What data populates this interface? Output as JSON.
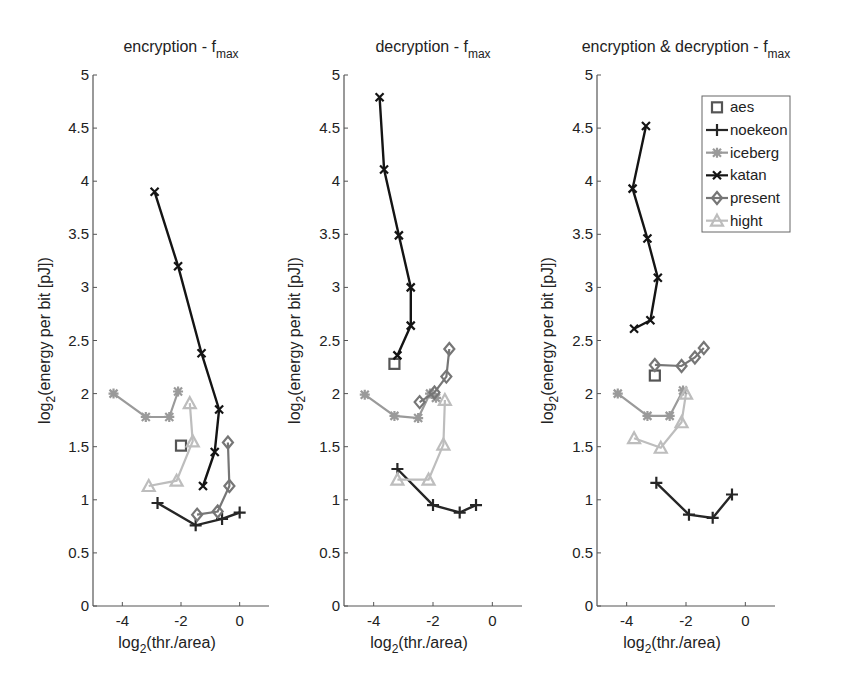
{
  "figure": {
    "width": 845,
    "height": 691,
    "ylabel": "log2(energy per bit [pJ])",
    "ylabel_main": "log",
    "ylabel_sub": "2",
    "ylabel_rest": "(energy per bit [pJ])",
    "xlabel_main": "log",
    "xlabel_sub": "2",
    "xlabel_rest": "(thr./area)",
    "colors": {
      "aes": "#555555",
      "noekeon": "#262626",
      "iceberg": "#9a9a9a",
      "katan": "#141414",
      "present": "#767676",
      "hight": "#bdbdbd",
      "axis": "#555555"
    }
  },
  "legend": {
    "entries": [
      {
        "name": "aes",
        "marker": "square"
      },
      {
        "name": "noekeon",
        "marker": "plus"
      },
      {
        "name": "iceberg",
        "marker": "star"
      },
      {
        "name": "katan",
        "marker": "x"
      },
      {
        "name": "present",
        "marker": "diamond"
      },
      {
        "name": "hight",
        "marker": "triangle"
      }
    ]
  },
  "chart_data": [
    {
      "type": "line",
      "title": "encryption - f_max",
      "title_main": "encryption - f",
      "title_sub": "max",
      "xlabel": "log2(thr./area)",
      "ylabel": "log2(energy per bit [pJ])",
      "xlim": [
        -5,
        1
      ],
      "ylim": [
        0,
        5
      ],
      "xticks": [
        -4,
        -2,
        0
      ],
      "yticks": [
        0,
        0.5,
        1,
        1.5,
        2,
        2.5,
        3,
        3.5,
        4,
        4.5,
        5
      ],
      "ytick_labels": [
        "0",
        "0.5",
        "1",
        "1.5",
        "2",
        "2.5",
        "3",
        "3.5",
        "4",
        "4.5",
        "5"
      ],
      "grid": false,
      "legend": false,
      "series": [
        {
          "name": "aes",
          "points": [
            [
              -2.0,
              1.51
            ]
          ]
        },
        {
          "name": "noekeon",
          "points": [
            [
              -2.8,
              0.97
            ],
            [
              -1.5,
              0.76
            ],
            [
              -0.6,
              0.82
            ],
            [
              0.0,
              0.88
            ]
          ]
        },
        {
          "name": "iceberg",
          "points": [
            [
              -4.3,
              2.0
            ],
            [
              -3.2,
              1.78
            ],
            [
              -2.4,
              1.78
            ],
            [
              -2.1,
              2.02
            ]
          ]
        },
        {
          "name": "katan",
          "points": [
            [
              -2.9,
              3.9
            ],
            [
              -2.1,
              3.2
            ],
            [
              -1.3,
              2.38
            ],
            [
              -0.7,
              1.85
            ],
            [
              -0.85,
              1.45
            ],
            [
              -1.25,
              1.13
            ]
          ]
        },
        {
          "name": "present",
          "points": [
            [
              -1.45,
              0.86
            ],
            [
              -0.75,
              0.89
            ],
            [
              -0.35,
              1.13
            ],
            [
              -0.4,
              1.54
            ]
          ]
        },
        {
          "name": "hight",
          "points": [
            [
              -3.1,
              1.13
            ],
            [
              -2.15,
              1.18
            ],
            [
              -1.6,
              1.55
            ],
            [
              -1.7,
              1.91
            ]
          ]
        }
      ]
    },
    {
      "type": "line",
      "title": "decryption - f_max",
      "title_main": "decryption - f",
      "title_sub": "max",
      "xlabel": "log2(thr./area)",
      "ylabel": "log2(energy per bit [pJ])",
      "xlim": [
        -5,
        1
      ],
      "ylim": [
        0,
        5
      ],
      "xticks": [
        -4,
        -2,
        0
      ],
      "yticks": [
        0,
        0.5,
        1,
        1.5,
        2,
        2.5,
        3,
        3.5,
        4,
        4.5,
        5
      ],
      "ytick_labels": [
        "0",
        "0.5",
        "1",
        "1.5",
        "2",
        "2.5",
        "3",
        "3.5",
        "4",
        "4.5",
        "5"
      ],
      "grid": false,
      "legend": false,
      "series": [
        {
          "name": "aes",
          "points": [
            [
              -3.3,
              2.28
            ]
          ]
        },
        {
          "name": "noekeon",
          "points": [
            [
              -3.2,
              1.29
            ],
            [
              -2.0,
              0.95
            ],
            [
              -1.1,
              0.88
            ],
            [
              -0.55,
              0.95
            ]
          ]
        },
        {
          "name": "iceberg",
          "points": [
            [
              -4.3,
              1.99
            ],
            [
              -3.3,
              1.79
            ],
            [
              -2.5,
              1.77
            ],
            [
              -2.1,
              2.0
            ],
            [
              -1.9,
              1.96
            ]
          ]
        },
        {
          "name": "katan",
          "points": [
            [
              -3.8,
              4.79
            ],
            [
              -3.65,
              4.11
            ],
            [
              -3.15,
              3.49
            ],
            [
              -2.75,
              3.0
            ],
            [
              -2.75,
              2.64
            ],
            [
              -3.2,
              2.36
            ]
          ]
        },
        {
          "name": "present",
          "points": [
            [
              -2.45,
              1.92
            ],
            [
              -1.95,
              2.01
            ],
            [
              -1.55,
              2.16
            ],
            [
              -1.45,
              2.42
            ]
          ]
        },
        {
          "name": "hight",
          "points": [
            [
              -3.2,
              1.19
            ],
            [
              -2.15,
              1.19
            ],
            [
              -1.65,
              1.52
            ],
            [
              -1.6,
              1.94
            ]
          ]
        }
      ]
    },
    {
      "type": "line",
      "title": "encryption & decryption - f_max",
      "title_main": "encryption & decryption - f",
      "title_sub": "max",
      "xlabel": "log2(thr./area)",
      "ylabel": "log2(energy per bit [pJ])",
      "xlim": [
        -5,
        1
      ],
      "ylim": [
        0,
        5
      ],
      "xticks": [
        -4,
        -2,
        0
      ],
      "yticks": [
        0,
        0.5,
        1,
        1.5,
        2,
        2.5,
        3,
        3.5,
        4,
        4.5,
        5
      ],
      "ytick_labels": [
        "0",
        "0.5",
        "1",
        "1.5",
        "2",
        "2.5",
        "3",
        "3.5",
        "4",
        "4.5",
        "5"
      ],
      "grid": false,
      "legend": true,
      "legend_position": "upper right",
      "series": [
        {
          "name": "aes",
          "points": [
            [
              -3.05,
              2.17
            ]
          ]
        },
        {
          "name": "noekeon",
          "points": [
            [
              -3.0,
              1.16
            ],
            [
              -1.9,
              0.86
            ],
            [
              -1.1,
              0.83
            ],
            [
              -0.45,
              1.05
            ]
          ]
        },
        {
          "name": "iceberg",
          "points": [
            [
              -4.3,
              2.0
            ],
            [
              -3.3,
              1.79
            ],
            [
              -2.55,
              1.79
            ],
            [
              -2.1,
              2.03
            ]
          ]
        },
        {
          "name": "katan",
          "points": [
            [
              -3.35,
              4.52
            ],
            [
              -3.8,
              3.93
            ],
            [
              -3.3,
              3.46
            ],
            [
              -2.95,
              3.09
            ],
            [
              -3.2,
              2.69
            ],
            [
              -3.75,
              2.61
            ]
          ]
        },
        {
          "name": "present",
          "points": [
            [
              -3.05,
              2.27
            ],
            [
              -2.15,
              2.26
            ],
            [
              -1.7,
              2.34
            ],
            [
              -1.4,
              2.43
            ]
          ]
        },
        {
          "name": "hight",
          "points": [
            [
              -3.75,
              1.58
            ],
            [
              -2.85,
              1.49
            ],
            [
              -2.15,
              1.73
            ],
            [
              -2.0,
              2.0
            ]
          ]
        }
      ]
    }
  ],
  "layout": {
    "panels": [
      {
        "x0": 93,
        "x1": 269,
        "y0": 606,
        "y1": 75,
        "title_x": 181,
        "title_y": 52,
        "ylabel_x": 50
      },
      {
        "x0": 344,
        "x1": 522,
        "y0": 606,
        "y1": 75,
        "title_x": 433,
        "title_y": 52,
        "ylabel_x": 300
      },
      {
        "x0": 597,
        "x1": 775,
        "y0": 606,
        "y1": 75,
        "title_x": 686,
        "title_y": 52,
        "ylabel_x": 553
      }
    ],
    "legend_box": {
      "x": 702,
      "y": 96,
      "w": 88,
      "h": 136
    }
  }
}
